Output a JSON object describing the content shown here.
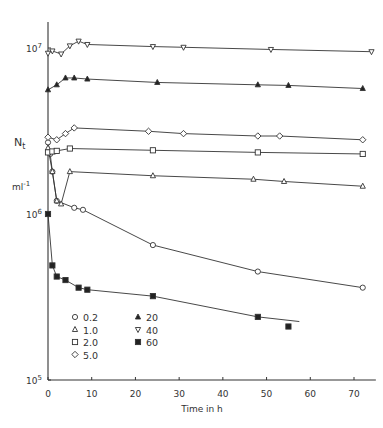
{
  "chart_data": {
    "type": "line",
    "title": "",
    "xlabel": "Time in h",
    "ylabel": "N_t",
    "ylabel_unit": "ml^-1",
    "yscale": "log",
    "xlim": [
      0,
      75
    ],
    "ylim": [
      100000,
      15000000
    ],
    "x_ticks": [
      0,
      10,
      20,
      30,
      40,
      50,
      60,
      70
    ],
    "y_ticks": [
      {
        "value": 100000,
        "label": "10^5"
      },
      {
        "value": 1000000,
        "label": "10^6"
      },
      {
        "value": 10000000,
        "label": "10^7"
      }
    ],
    "grid": false,
    "legend_position": "lower-left inside",
    "series": [
      {
        "name": "0.2",
        "marker": "circle-open",
        "x": [
          0,
          0.5,
          1,
          2,
          6,
          8,
          24,
          48,
          72
        ],
        "y": [
          2700000,
          2300000,
          1800000,
          1200000,
          1090000,
          1060000,
          650000,
          450000,
          360000
        ]
      },
      {
        "name": "1.0",
        "marker": "triangle-up-open",
        "x": [
          0,
          1,
          2,
          3,
          5,
          24,
          47,
          54,
          72
        ],
        "y": [
          2500000,
          1800000,
          1200000,
          1150000,
          1800000,
          1700000,
          1620000,
          1570000,
          1470000
        ]
      },
      {
        "name": "2.0",
        "marker": "square-open",
        "x": [
          0,
          1,
          2,
          5,
          24,
          48,
          72
        ],
        "y": [
          2350000,
          2380000,
          2400000,
          2480000,
          2420000,
          2350000,
          2300000
        ]
      },
      {
        "name": "5.0",
        "marker": "diamond-open",
        "x": [
          0,
          2,
          4,
          6,
          23,
          31,
          48,
          53,
          72
        ],
        "y": [
          2900000,
          2800000,
          3050000,
          3300000,
          3150000,
          3050000,
          2950000,
          2950000,
          2800000
        ]
      },
      {
        "name": "20",
        "marker": "triangle-up-filled",
        "x": [
          0,
          2,
          4,
          6,
          9,
          25,
          48,
          55,
          72
        ],
        "y": [
          5600000,
          6000000,
          6600000,
          6600000,
          6500000,
          6200000,
          6000000,
          5950000,
          5700000
        ]
      },
      {
        "name": "40",
        "marker": "triangle-down-open",
        "x": [
          0,
          1,
          3,
          5,
          7,
          9,
          24,
          31,
          51,
          74
        ],
        "y": [
          9300000,
          9600000,
          9200000,
          10300000,
          11000000,
          10500000,
          10200000,
          10100000,
          9800000,
          9500000
        ]
      },
      {
        "name": "60",
        "marker": "square-filled",
        "x": [
          0,
          1,
          2,
          4,
          7,
          9,
          24,
          48,
          55
        ],
        "y": [
          1000000,
          490000,
          420000,
          400000,
          360000,
          350000,
          320000,
          240000,
          210000
        ]
      }
    ]
  },
  "legend": {
    "col1": [
      {
        "symbol": "○",
        "label": "0.2"
      },
      {
        "symbol": "△",
        "label": "1.0"
      },
      {
        "symbol": "□",
        "label": "2.0"
      },
      {
        "symbol": "◇",
        "label": "5.0"
      }
    ],
    "col2": [
      {
        "symbol": "▲",
        "label": "20"
      },
      {
        "symbol": "▽",
        "label": "40"
      },
      {
        "symbol": "■",
        "label": "60"
      }
    ]
  },
  "axis_labels": {
    "y_main": "N",
    "y_sub": "t",
    "y_unit": "ml",
    "y_unit_exp": "-1",
    "x": "Time in h"
  }
}
